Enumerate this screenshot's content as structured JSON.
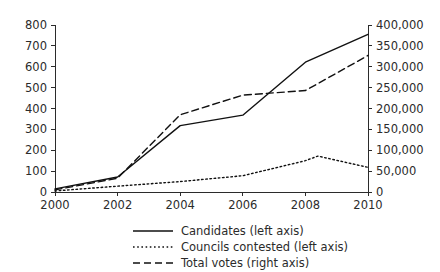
{
  "chart_data": {
    "type": "line",
    "title": "",
    "subtitle": "",
    "xlabel": "",
    "ylabel": "",
    "y2label": "",
    "grid": false,
    "legend_position": "bottom",
    "x": [
      2000,
      2002,
      2004,
      2006,
      2008,
      2010
    ],
    "xtick_labels": [
      "2000",
      "2002",
      "2004",
      "2006",
      "2008",
      "2010"
    ],
    "xlim": [
      2000,
      2010
    ],
    "ylim": [
      0,
      800
    ],
    "ytick_values": [
      0,
      100,
      200,
      300,
      400,
      500,
      600,
      700,
      800
    ],
    "ytick_labels": [
      "0",
      "100",
      "200",
      "300",
      "400",
      "500",
      "600",
      "700",
      "800"
    ],
    "y2lim": [
      0,
      400000
    ],
    "y2tick_values": [
      0,
      50000,
      100000,
      150000,
      200000,
      250000,
      300000,
      350000,
      400000
    ],
    "y2tick_labels": [
      "0",
      "50,000",
      "100,000",
      "150,000",
      "200,000",
      "250,000",
      "300,000",
      "350,000",
      "400,000"
    ],
    "series": [
      {
        "name": "Candidates (left axis)",
        "axis": "left",
        "style": "solid",
        "color": "#111111",
        "x": [
          2000,
          2002,
          2004,
          2006,
          2008,
          2010
        ],
        "values": [
          15,
          72,
          318,
          368,
          622,
          755
        ]
      },
      {
        "name": "Councils contested (left axis)",
        "axis": "left",
        "style": "dotted",
        "color": "#111111",
        "x": [
          2000,
          2002,
          2004,
          2006,
          2008,
          2008.4,
          2010
        ],
        "values": [
          5,
          28,
          50,
          78,
          150,
          172,
          118
        ]
      },
      {
        "name": "Total votes (right axis)",
        "axis": "right",
        "style": "dashed",
        "color": "#111111",
        "x": [
          2000,
          2002,
          2004,
          2006,
          2008,
          2010
        ],
        "values": [
          5000,
          33000,
          185000,
          232000,
          243000,
          327000
        ]
      }
    ],
    "legend": [
      {
        "label": "Candidates (left axis)",
        "style": "solid"
      },
      {
        "label": "Councils contested (left axis)",
        "style": "dotted"
      },
      {
        "label": "Total votes (right axis)",
        "style": "dashed"
      }
    ]
  }
}
